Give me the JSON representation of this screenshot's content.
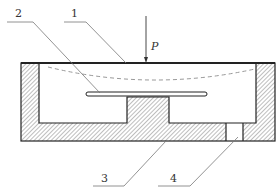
{
  "diagram": {
    "type": "mechanical-cross-section",
    "load": {
      "symbol": "P",
      "direction": "down"
    },
    "callouts": [
      {
        "id": "1",
        "label": "1",
        "target": "top-plate"
      },
      {
        "id": "2",
        "label": "2",
        "target": "tube"
      },
      {
        "id": "3",
        "label": "3",
        "target": "base-housing"
      },
      {
        "id": "4",
        "label": "4",
        "target": "vent-hole"
      }
    ],
    "colors": {
      "line": "#222222",
      "leader": "#777777",
      "hatch": "#888888",
      "dashed": "#999999"
    }
  }
}
